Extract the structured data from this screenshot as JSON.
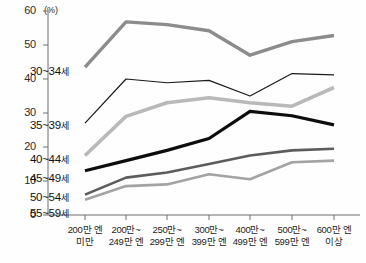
{
  "chart_data": {
    "type": "line",
    "title": "",
    "subtitle": "",
    "unit_label": "(%)",
    "xlabel": "",
    "ylabel": "",
    "ylim": [
      0,
      60
    ],
    "yticks": [
      0,
      10,
      20,
      30,
      40,
      50,
      60
    ],
    "ytick_labels": [
      "0",
      "10",
      "20",
      "30",
      "40",
      "50",
      "60"
    ],
    "grid": false,
    "legend_position": "inline-left",
    "categories": [
      "200만 엔 미만",
      "200만~249만 엔",
      "250만~299만 엔",
      "300만~399만 엔",
      "400만~499만 엔",
      "500만~599만 엔",
      "600만 엔 이상"
    ],
    "xtick_lines": [
      [
        "200만 엔",
        "미만"
      ],
      [
        "200만~",
        "249만 엔"
      ],
      [
        "250만~",
        "299만 엔"
      ],
      [
        "300만~",
        "399만 엔"
      ],
      [
        "400만~",
        "499만 엔"
      ],
      [
        "500만~",
        "599만 엔"
      ],
      [
        "600만 엔",
        "이상"
      ]
    ],
    "series": [
      {
        "name": "30~34세",
        "color": "#8c8c8c",
        "width": 3.4,
        "values": [
          43.5,
          56.8,
          56.0,
          54.2,
          47.0,
          51.0,
          52.8
        ]
      },
      {
        "name": "35~39세",
        "color": "#1a1a1a",
        "width": 1.2,
        "values": [
          27.0,
          40.0,
          38.9,
          39.6,
          35.0,
          41.6,
          41.2
        ]
      },
      {
        "name": "40~44세",
        "color": "#b9b9b9",
        "width": 3.6,
        "values": [
          17.5,
          29.0,
          33.0,
          34.5,
          33.0,
          32.0,
          37.5
        ]
      },
      {
        "name": "45~49세",
        "color": "#0d0d0d",
        "width": 3.2,
        "values": [
          13.0,
          16.0,
          19.0,
          22.5,
          30.5,
          29.2,
          26.5
        ]
      },
      {
        "name": "50~54세",
        "color": "#5c5c5c",
        "width": 2.6,
        "values": [
          6.0,
          11.0,
          12.5,
          15.0,
          17.5,
          19.0,
          19.5
        ]
      },
      {
        "name": "55~59세",
        "color": "#a3a3a3",
        "width": 2.6,
        "values": [
          4.5,
          8.5,
          9.0,
          12.0,
          10.5,
          15.5,
          16.0
        ]
      }
    ],
    "series_labels": [
      {
        "text": "30~34세",
        "left": 30,
        "top": 65
      },
      {
        "text": "35~39세",
        "left": 30,
        "top": 119
      },
      {
        "text": "40~44세",
        "left": 30,
        "top": 153
      },
      {
        "text": "45~49세",
        "left": 30,
        "top": 172
      },
      {
        "text": "50~54세",
        "left": 30,
        "top": 191
      },
      {
        "text": "55~59세",
        "left": 30,
        "top": 207
      }
    ]
  }
}
